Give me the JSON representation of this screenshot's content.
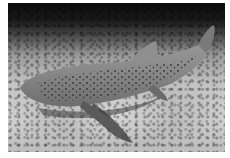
{
  "image": {
    "alt": "Grayscale photograph of a spotted leopard (zebra) shark resting on a sandy, rocky seafloor",
    "subject": "leopard-shark",
    "style": "grayscale photograph",
    "colors": {
      "background": "#ffffff",
      "water_dark": "#0c0c0c",
      "seafloor_light": "#cfcfcf",
      "shark_body": "#8a8a8a",
      "shark_spots": "#3a3a3a",
      "shadow": "#3c3c3c"
    }
  }
}
